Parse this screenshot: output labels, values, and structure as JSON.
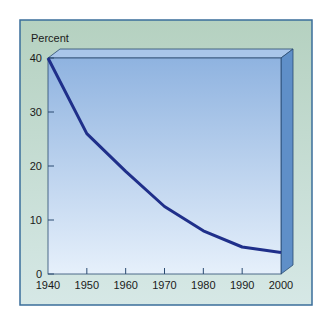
{
  "chart_data": {
    "type": "line",
    "title": "",
    "xlabel": "",
    "ylabel": "Percent",
    "x": [
      1940,
      1950,
      1960,
      1970,
      1980,
      1990,
      2000
    ],
    "series": [
      {
        "name": "Percent",
        "values": [
          40,
          26,
          19,
          12.5,
          8,
          5,
          4
        ],
        "color": "#1f2f8a"
      }
    ],
    "xticks": [
      "1940",
      "1950",
      "1960",
      "1970",
      "1980",
      "1990",
      "2000"
    ],
    "yticks": [
      "0",
      "10",
      "20",
      "30",
      "40"
    ],
    "ylim": [
      0,
      40
    ],
    "xlim": [
      1940,
      2000
    ],
    "grid": false,
    "legend": "none",
    "style": "3d-box plot area"
  },
  "colors": {
    "frame_bg": "#b9d4c4",
    "frame_border": "#3a6e9a",
    "plot_top": "#8fb3e0",
    "plot_bottom": "#e3eefa",
    "side_face": "#5f8fc8",
    "top_face": "#a9c6ea",
    "line": "#1f2f8a"
  }
}
